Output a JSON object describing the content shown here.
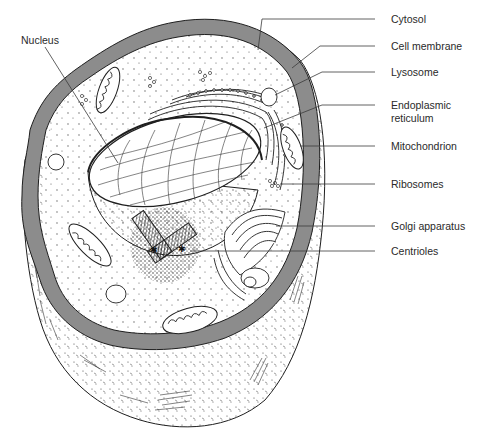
{
  "diagram": {
    "colors": {
      "membrane_fill": "#8c8c8c",
      "outline": "#1f1f1f",
      "leader_line": "#3a3a3a",
      "label_text": "#2a2a2a",
      "background": "#ffffff"
    },
    "labels": {
      "nucleus": "Nucleus",
      "cytosol": "Cytosol",
      "cell_membrane": "Cell membrane",
      "lysosome": "Lysosome",
      "endoplasmic_reticulum_line1": "Endoplasmic",
      "endoplasmic_reticulum_line2": "reticulum",
      "mitochondrion": "Mitochondrion",
      "ribosomes": "Ribosomes",
      "golgi_apparatus": "Golgi apparatus",
      "centrioles": "Centrioles"
    }
  }
}
